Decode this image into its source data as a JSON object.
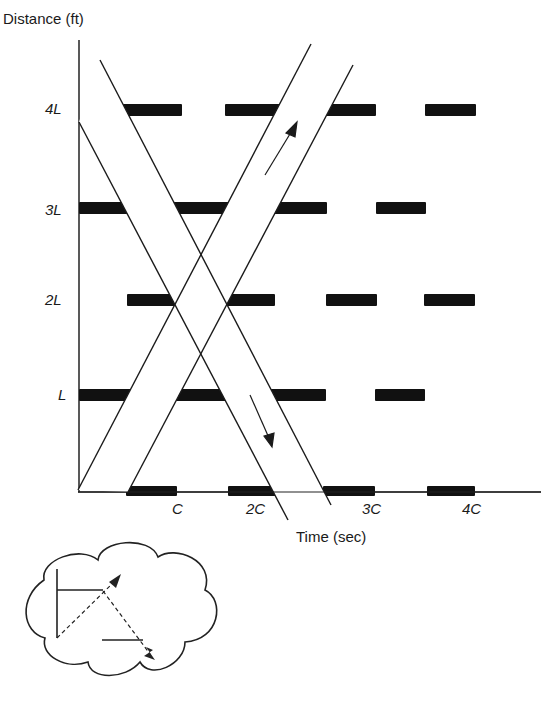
{
  "chart_data": {
    "type": "diagram",
    "ylabel": "Distance (ft)",
    "xlabel": "Time (sec)",
    "y_ticks": [
      {
        "label": "L",
        "y": 395
      },
      {
        "label": "2L",
        "y": 300
      },
      {
        "label": "3L",
        "y": 208
      },
      {
        "label": "4L",
        "y": 110
      }
    ],
    "x_ticks": [
      {
        "label": "C",
        "x": 177
      },
      {
        "label": "2C",
        "x": 257
      },
      {
        "label": "3C",
        "x": 369
      },
      {
        "label": "4C",
        "x": 471
      }
    ],
    "signal_rows": [
      {
        "level": "0",
        "y": 492,
        "red": [
          [
            126,
            177
          ],
          [
            228,
            276
          ],
          [
            323,
            375
          ],
          [
            427,
            475
          ]
        ]
      },
      {
        "level": "L",
        "y": 395,
        "red": [
          [
            79,
            326
          ],
          [
            375,
            425
          ]
        ]
      },
      {
        "level": "2L",
        "y": 300,
        "red": [
          [
            127,
            275
          ],
          [
            326,
            377
          ],
          [
            424,
            475
          ]
        ]
      },
      {
        "level": "3L",
        "y": 208,
        "red": [
          [
            79,
            327
          ],
          [
            376,
            426
          ]
        ]
      },
      {
        "level": "4L",
        "y": 110,
        "red": [
          [
            122,
            182
          ],
          [
            225,
            376
          ],
          [
            425,
            476
          ]
        ]
      }
    ],
    "bands": [
      {
        "name": "outbound",
        "direction": "up",
        "edge1": [
          [
            78,
            490
          ],
          [
            311,
            44
          ]
        ],
        "edge2": [
          [
            128,
            492
          ],
          [
            353,
            65
          ]
        ],
        "arrow": [
          [
            265,
            175
          ],
          [
            296,
            124
          ]
        ]
      },
      {
        "name": "inbound",
        "direction": "down",
        "edge1": [
          [
            100,
            60
          ],
          [
            331,
            505
          ]
        ],
        "edge2": [
          [
            79,
            122
          ],
          [
            288,
            520
          ]
        ],
        "arrow": [
          [
            250,
            395
          ],
          [
            272,
            446
          ]
        ]
      }
    ]
  },
  "labels": {
    "y_axis": "Distance (ft)",
    "x_axis": "Time (sec)",
    "tick_L": "L",
    "tick_2L": "2L",
    "tick_3L": "3L",
    "tick_4L": "4L",
    "tick_C": "C",
    "tick_2C": "2C",
    "tick_3C": "3C",
    "tick_4C": "4C"
  },
  "inset": {
    "name": "cloud-vector-inset"
  }
}
